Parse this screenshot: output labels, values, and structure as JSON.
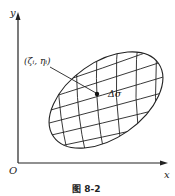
{
  "figure": {
    "caption": "图 8-2",
    "axes": {
      "x_label": "x",
      "y_label": "y",
      "origin_label": "O"
    },
    "region": {
      "description": "elliptical region partitioned by curved grid lines",
      "point_label": "(ζᵢ, ηᵢ)",
      "element_label": "Δσ"
    },
    "colors": {
      "stroke": "#222222",
      "background": "#ffffff"
    }
  }
}
